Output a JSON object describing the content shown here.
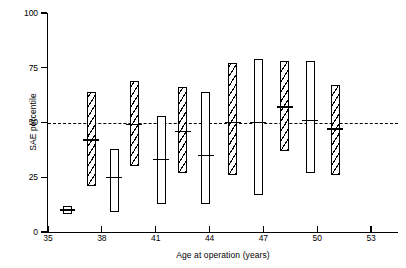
{
  "chart_data": {
    "type": "bar",
    "title": "",
    "subtitle": "",
    "xlabel": "Age at operation (years)",
    "ylabel": "SAE percentile",
    "xlim": [
      35,
      54.5
    ],
    "ylim": [
      0,
      100
    ],
    "x_ticks": [
      35,
      38,
      41,
      44,
      47,
      50,
      53
    ],
    "x_tick_labels": [
      "35",
      "38",
      "41",
      "44",
      "47",
      "50",
      "53"
    ],
    "y_ticks": [
      0,
      25,
      50,
      75,
      100
    ],
    "y_tick_labels": [
      "0",
      "25",
      "50",
      "75",
      "100"
    ],
    "grid": false,
    "legend": "none",
    "reference_line": {
      "value": 50,
      "style": "dashed",
      "label": ""
    },
    "annotations": [],
    "series": [
      {
        "name": "Range bars (high-median-low)",
        "points": [
          {
            "x": 36.1,
            "fill": "open",
            "low": 8,
            "median": 10,
            "high": 12
          },
          {
            "x": 37.4,
            "fill": "hatched",
            "low": 21,
            "median": 42,
            "high": 64
          },
          {
            "x": 38.7,
            "fill": "open",
            "low": 9,
            "median": 25,
            "high": 38
          },
          {
            "x": 39.8,
            "fill": "hatched",
            "low": 30,
            "median": 49,
            "high": 69
          },
          {
            "x": 41.3,
            "fill": "open",
            "low": 13,
            "median": 33,
            "high": 53
          },
          {
            "x": 42.5,
            "fill": "hatched",
            "low": 27,
            "median": 46,
            "high": 66
          },
          {
            "x": 43.8,
            "fill": "open",
            "low": 13,
            "median": 35,
            "high": 64
          },
          {
            "x": 45.3,
            "fill": "hatched",
            "low": 26,
            "median": 50,
            "high": 77
          },
          {
            "x": 46.7,
            "fill": "open",
            "low": 17,
            "median": 50,
            "high": 79
          },
          {
            "x": 48.2,
            "fill": "hatched",
            "low": 37,
            "median": 57,
            "high": 78
          },
          {
            "x": 49.6,
            "fill": "open",
            "low": 27,
            "median": 51,
            "high": 78
          },
          {
            "x": 51.0,
            "fill": "hatched",
            "low": 26,
            "median": 47,
            "high": 67
          }
        ]
      }
    ]
  }
}
